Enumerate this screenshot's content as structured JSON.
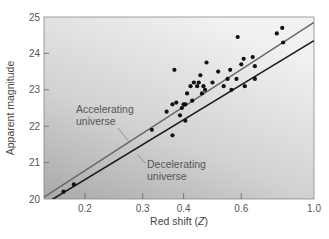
{
  "chart_data": {
    "type": "scatter",
    "title": "",
    "xlabel": "Red shift (Z)",
    "xlabel_main": "Red shift (",
    "xlabel_var": "Z",
    "xlabel_close": ")",
    "ylabel": "Apparent magnitude",
    "xscale": "log",
    "xlim": [
      0.15,
      1.0
    ],
    "ylim": [
      20,
      25
    ],
    "x_ticks": [
      "0.2",
      "0.3",
      "0.4",
      "0.6",
      "1.0"
    ],
    "y_ticks": [
      "20",
      "21",
      "22",
      "23",
      "24",
      "25"
    ],
    "grid": false,
    "background": "gray gradient (light top, darker bottom-left)",
    "series": [
      {
        "name": "Supernova observations",
        "type": "scatter",
        "points": [
          [
            0.172,
            20.2
          ],
          [
            0.185,
            20.4
          ],
          [
            0.32,
            21.9
          ],
          [
            0.37,
            21.75
          ],
          [
            0.355,
            22.4
          ],
          [
            0.37,
            22.6
          ],
          [
            0.375,
            23.55
          ],
          [
            0.38,
            22.65
          ],
          [
            0.39,
            22.3
          ],
          [
            0.395,
            22.5
          ],
          [
            0.4,
            22.6
          ],
          [
            0.405,
            22.6
          ],
          [
            0.41,
            22.9
          ],
          [
            0.405,
            22.15
          ],
          [
            0.42,
            23.1
          ],
          [
            0.425,
            22.7
          ],
          [
            0.43,
            23.2
          ],
          [
            0.44,
            23.1
          ],
          [
            0.445,
            23.2
          ],
          [
            0.45,
            23.4
          ],
          [
            0.455,
            22.9
          ],
          [
            0.46,
            23.1
          ],
          [
            0.465,
            23.0
          ],
          [
            0.47,
            23.75
          ],
          [
            0.49,
            23.2
          ],
          [
            0.51,
            23.5
          ],
          [
            0.53,
            23.1
          ],
          [
            0.545,
            23.3
          ],
          [
            0.555,
            23.55
          ],
          [
            0.56,
            23.0
          ],
          [
            0.58,
            23.3
          ],
          [
            0.585,
            24.45
          ],
          [
            0.6,
            23.7
          ],
          [
            0.61,
            23.85
          ],
          [
            0.615,
            23.1
          ],
          [
            0.65,
            23.9
          ],
          [
            0.66,
            23.65
          ],
          [
            0.66,
            23.3
          ],
          [
            0.77,
            24.55
          ],
          [
            0.8,
            24.7
          ],
          [
            0.805,
            24.3
          ]
        ]
      },
      {
        "name": "Accelerating universe",
        "type": "line",
        "color": "#666666",
        "x": [
          0.15,
          1.0
        ],
        "y": [
          20.05,
          24.85
        ]
      },
      {
        "name": "Decelerating universe",
        "type": "line",
        "color": "#1a1a1a",
        "x": [
          0.15,
          1.0
        ],
        "y": [
          19.85,
          24.35
        ]
      }
    ],
    "annotations": [
      {
        "text_line1": "Accelerating",
        "text_line2": "universe",
        "points_to": "Accelerating universe"
      },
      {
        "text_line1": "Decelerating",
        "text_line2": "universe",
        "points_to": "Decelerating universe"
      }
    ]
  }
}
